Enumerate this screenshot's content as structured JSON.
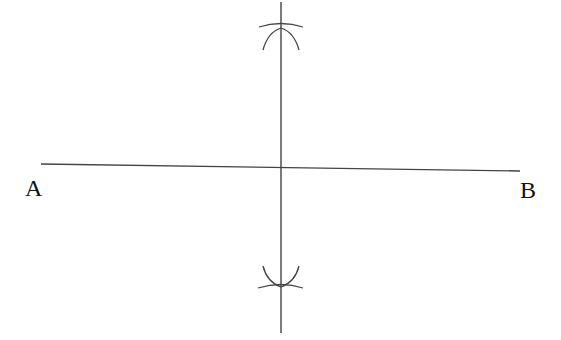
{
  "diagram": {
    "labels": {
      "point_a": "A",
      "point_b": "B"
    },
    "colors": {
      "stroke": "#444444",
      "text": "#111111"
    }
  }
}
